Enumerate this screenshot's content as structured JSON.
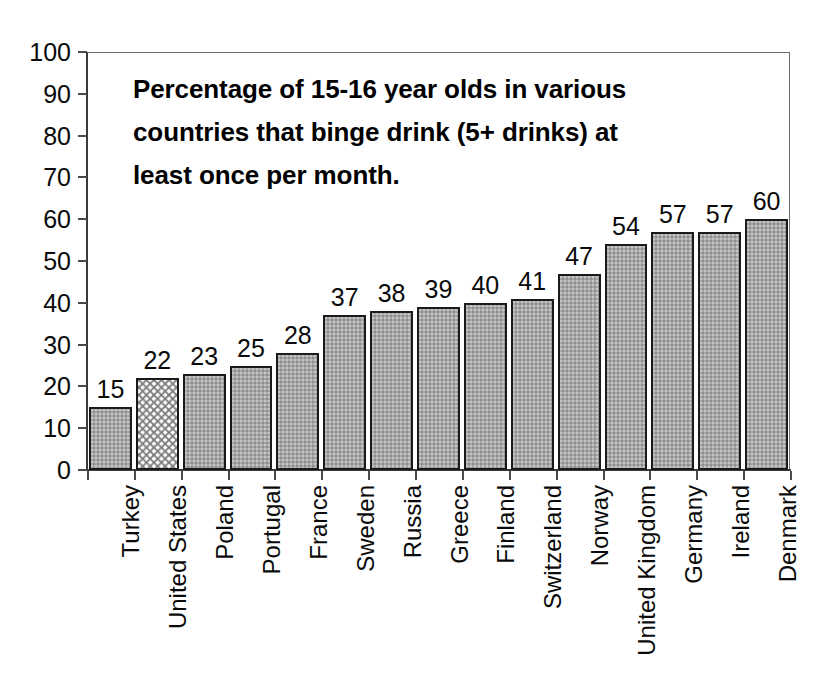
{
  "chart_data": {
    "type": "bar",
    "title_lines": [
      "Percentage of 15-16 year olds in various",
      "countries that binge drink (5+ drinks) at",
      "least once per month."
    ],
    "xlabel": "",
    "ylabel": "",
    "ylim": [
      0,
      100
    ],
    "y_ticks": [
      0,
      10,
      20,
      30,
      40,
      50,
      60,
      70,
      80,
      90,
      100
    ],
    "grid": false,
    "legend": null,
    "categories": [
      "Turkey",
      "United States",
      "Poland",
      "Portugal",
      "France",
      "Sweden",
      "Russia",
      "Greece",
      "Finland",
      "Switzerland",
      "Norway",
      "United Kingdom",
      "Germany",
      "Ireland",
      "Denmark"
    ],
    "values": [
      15,
      22,
      23,
      25,
      28,
      37,
      38,
      39,
      40,
      41,
      47,
      54,
      57,
      57,
      60
    ],
    "value_labels": [
      "15",
      "22",
      "23",
      "25",
      "28",
      "37",
      "38",
      "39",
      "40",
      "41",
      "47",
      "54",
      "57",
      "57",
      "60"
    ],
    "highlight_index": 1,
    "highlight_category": "United States",
    "colors": {
      "bar_fill": "#a6a6a6",
      "bar_border": "#1a1a1a",
      "highlight_fill": "#fbfbfb",
      "highlight_pattern": "#787878",
      "axis": "#3a3a3a",
      "text": "#0a0a0a",
      "background": "#ffffff"
    }
  }
}
